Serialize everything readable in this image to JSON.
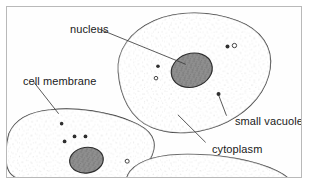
{
  "figure": {
    "background_color": "#ffffff",
    "frame_color": "#b9b9b9",
    "ink_color": "#1a1a1a"
  },
  "labels": {
    "nucleus": "nucleus",
    "cell_membrane": "cell membrane",
    "small_vacuole": "small vacuole",
    "cytoplasm": "cytoplasm"
  },
  "diagram": {
    "cells": [
      {
        "name": "top-cell",
        "outline": "M 112 66 C 110 44 124 25 148 14 C 172 3 206 4 232 14 C 256 23 268 41 265 62 C 262 84 246 104 222 116 C 198 128 168 131 146 122 C 124 113 114 90 112 66 Z",
        "nucleus": {
          "cx": 186,
          "cy": 64,
          "rx": 21,
          "ry": 17,
          "rotation": -18
        },
        "vacuoles": [
          {
            "cx": 152,
            "cy": 60,
            "r": 1.8,
            "filled": true
          },
          {
            "cx": 150,
            "cy": 72,
            "r": 1.8,
            "filled": false
          },
          {
            "cx": 222,
            "cy": 40,
            "r": 2.0,
            "filled": true
          },
          {
            "cx": 229,
            "cy": 39,
            "r": 2.2,
            "filled": false
          },
          {
            "cx": 213,
            "cy": 88,
            "r": 2.0,
            "filled": true
          }
        ]
      },
      {
        "name": "left-cell",
        "outline": "M 2 128 C 8 114 22 106 44 104 C 70 101 102 106 126 116 C 146 124 152 136 146 150 C 140 166 120 177 94 181 C 64 186 28 182 8 172 C -4 166 -2 144 2 128 Z",
        "nucleus": {
          "cx": 80,
          "cy": 155,
          "rx": 17,
          "ry": 13,
          "rotation": -8
        },
        "vacuoles": [
          {
            "cx": 55,
            "cy": 118,
            "r": 1.8,
            "filled": true
          },
          {
            "cx": 68,
            "cy": 131,
            "r": 1.9,
            "filled": true
          },
          {
            "cx": 79,
            "cy": 131,
            "r": 1.9,
            "filled": true
          },
          {
            "cx": 58,
            "cy": 136,
            "r": 1.9,
            "filled": true
          },
          {
            "cx": 121,
            "cy": 156,
            "r": 2.0,
            "filled": false
          }
        ]
      },
      {
        "name": "bottom-right-cell",
        "outline": "M 124 166 C 134 154 154 149 182 149 C 216 149 250 155 272 166 C 288 174 296 186 294 196 L 126 196 C 118 186 118 174 124 166 Z",
        "nucleus": null,
        "vacuoles": []
      }
    ],
    "leaders": [
      {
        "for": "nucleus",
        "path": "M 98 26 L 172 60"
      },
      {
        "for": "cell_membrane",
        "path": "M 33 80 L 58 112"
      },
      {
        "for": "small_vacuole",
        "path": "M 227 114 L 213 89"
      },
      {
        "for": "cytoplasm",
        "path": "M 206 141 L 178 113"
      }
    ],
    "stipple": {
      "dot_color": "#9a9a9a",
      "description": "fine speckled cytoplasm texture inside each cell"
    }
  }
}
